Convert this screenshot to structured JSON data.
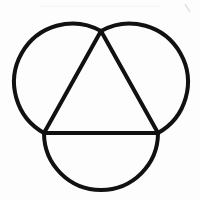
{
  "diagram": {
    "stroke_color": "#111111",
    "background_color": "#fdfdfd",
    "stroke_width": 4,
    "triangle": {
      "vertices": [
        [
          101,
          31
        ],
        [
          44,
          133
        ],
        [
          158,
          133
        ]
      ]
    },
    "arcs": [
      {
        "name": "left-arc",
        "from": [
          101,
          31
        ],
        "to": [
          44,
          133
        ],
        "radius": 58
      },
      {
        "name": "right-arc",
        "from": [
          101,
          31
        ],
        "to": [
          158,
          133
        ],
        "radius": 58
      },
      {
        "name": "bottom-arc",
        "from": [
          44,
          133
        ],
        "to": [
          158,
          133
        ],
        "radius": 57
      }
    ]
  }
}
